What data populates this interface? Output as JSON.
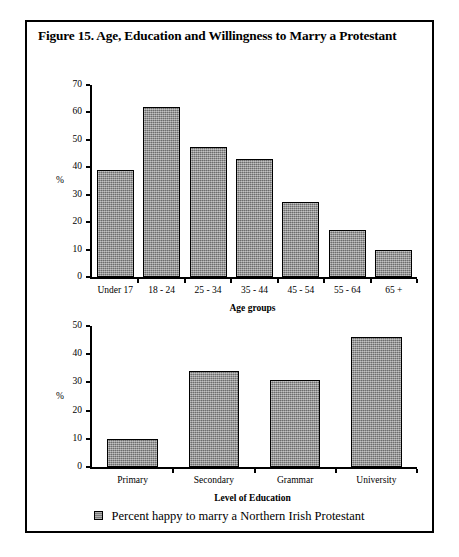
{
  "figure": {
    "title": "Figure 15. Age, Education and Willingness to Marry a Protestant",
    "border_color": "#000000",
    "background": "#ffffff"
  },
  "legend": {
    "marker": "filled-square-swatch",
    "label": "Percent happy to marry a Northern Irish Protestant",
    "color": "#8c8c8c"
  },
  "chart_data": [
    {
      "id": "age-chart",
      "type": "bar",
      "title": "",
      "categories": [
        "Under 17",
        "18 - 24",
        "25 - 34",
        "35 - 44",
        "45 - 54",
        "55 - 64",
        "65 +"
      ],
      "values": [
        39,
        62,
        47.5,
        43,
        27.5,
        17,
        10
      ],
      "series_name": "Percent happy to marry a Northern Irish Protestant",
      "xlabel": "Age groups",
      "ylabel": "%",
      "ylim": [
        0,
        70
      ],
      "yticks": [
        0,
        10,
        20,
        30,
        40,
        50,
        60,
        70
      ],
      "ytick_labels": [
        "0",
        "10",
        "20",
        "30",
        "40",
        "50",
        "60",
        "70"
      ],
      "grid": false,
      "bar_color": "#8c8c8c",
      "bar_edge_color": "#000000"
    },
    {
      "id": "education-chart",
      "type": "bar",
      "title": "",
      "categories": [
        "Primary",
        "Secondary",
        "Grammar",
        "University"
      ],
      "values": [
        10,
        34,
        31,
        46
      ],
      "series_name": "Percent happy to marry a Northern Irish Protestant",
      "xlabel": "Level of Education",
      "ylabel": "%",
      "ylim": [
        0,
        50
      ],
      "yticks": [
        0,
        10,
        20,
        30,
        40,
        50
      ],
      "ytick_labels": [
        "0",
        "10",
        "20",
        "30",
        "40",
        "50"
      ],
      "grid": false,
      "bar_color": "#8c8c8c",
      "bar_edge_color": "#000000"
    }
  ]
}
